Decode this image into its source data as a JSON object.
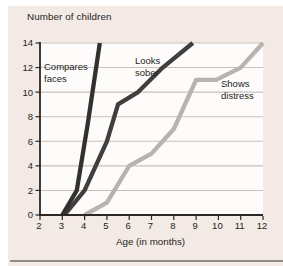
{
  "figure": {
    "panel_color": "#f3eae6",
    "plot_bg": "#fdfcfb",
    "grid_color": "#c9c1bd",
    "axis_color": "#2a2724",
    "text_color": "#252320",
    "rule_color": "#8e8c8a"
  },
  "chart_data": {
    "type": "line",
    "title": "Number of children",
    "xlabel": "Age (in months)",
    "ylabel": "Number of children",
    "xlim": [
      2,
      12
    ],
    "ylim": [
      0,
      14
    ],
    "xticks": [
      2,
      3,
      4,
      5,
      6,
      7,
      8,
      9,
      10,
      11,
      12
    ],
    "yticks": [
      0,
      2,
      4,
      6,
      8,
      10,
      12,
      14
    ],
    "grid": "horizontal gridlines at every y tick, no vertical gridlines",
    "legend_position": "labels drawn next to each curve inside plot",
    "series": [
      {
        "name": "Shows distress",
        "label_lines": [
          "Shows",
          "distress"
        ],
        "color": "#b6b3b0",
        "label_px": [
          221,
          87
        ],
        "points": [
          [
            4,
            0
          ],
          [
            5,
            1
          ],
          [
            6,
            4
          ],
          [
            7,
            5
          ],
          [
            8,
            7
          ],
          [
            9,
            11
          ],
          [
            9.9,
            11
          ],
          [
            11,
            12
          ],
          [
            12,
            14
          ]
        ]
      },
      {
        "name": "Looks sober",
        "label_lines": [
          "Looks",
          "sober"
        ],
        "color": "#413f3e",
        "label_px": [
          135,
          64
        ],
        "points": [
          [
            3.1,
            0
          ],
          [
            4,
            2
          ],
          [
            5,
            6
          ],
          [
            5.5,
            9
          ],
          [
            6.4,
            10
          ],
          [
            7.5,
            12
          ],
          [
            8.85,
            14
          ]
        ]
      },
      {
        "name": "Compares faces",
        "label_lines": [
          "Compares",
          "faces"
        ],
        "color": "#333130",
        "label_px": [
          44,
          70
        ],
        "points": [
          [
            3,
            0
          ],
          [
            3.65,
            2
          ],
          [
            4.15,
            7.5
          ],
          [
            4.68,
            14
          ]
        ]
      }
    ]
  }
}
